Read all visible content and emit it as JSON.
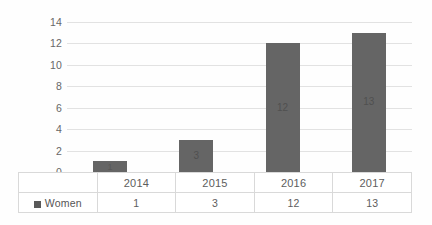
{
  "chart_data": {
    "type": "bar",
    "title": "",
    "subtitle": "",
    "xlabel": "",
    "ylabel": "",
    "categories": [
      "2014",
      "2015",
      "2016",
      "2017"
    ],
    "series": [
      {
        "name": "Women",
        "values": [
          1,
          3,
          12,
          13
        ]
      }
    ],
    "values": [
      1,
      3,
      12,
      13
    ],
    "data_labels": [
      "1",
      "3",
      "12",
      "13"
    ],
    "ylim": [
      0,
      14
    ],
    "y_ticks": [
      "0",
      "2",
      "4",
      "6",
      "8",
      "10",
      "12",
      "14"
    ],
    "y_tick_values": [
      0,
      2,
      4,
      6,
      8,
      10,
      12,
      14
    ],
    "grid": true,
    "legend_position": "bottom-left",
    "data_table_visible": true,
    "colors": {
      "bar": "#656565",
      "gridline": "#e2e2e2",
      "baseline": "#d2d2d2",
      "table_border": "#d9d9d9",
      "text": "#5a5a5a",
      "background": "#ffffff"
    }
  },
  "legend": {
    "marker": "square-swatch",
    "label": "Women"
  },
  "table": {
    "row_header_blank": "",
    "category_row": [
      "2014",
      "2015",
      "2016",
      "2017"
    ],
    "value_row": [
      "1",
      "3",
      "12",
      "13"
    ]
  }
}
